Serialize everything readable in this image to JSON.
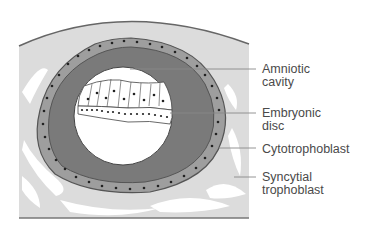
{
  "diagram": {
    "labels": [
      {
        "id": "amniotic-cavity",
        "lines": [
          "Amniotic",
          "cavity"
        ],
        "top": 63
      },
      {
        "id": "embryonic-disc",
        "lines": [
          "Embryonic",
          "disc"
        ],
        "top": 107
      },
      {
        "id": "cytotrophoblast",
        "lines": [
          "Cytotrophoblast"
        ],
        "top": 143
      },
      {
        "id": "syncytial-trophoblast",
        "lines": [
          "Syncytial",
          "trophoblast"
        ],
        "top": 171
      }
    ],
    "colors": {
      "endometrium": "#dcdcdc",
      "outer_line": "#666666",
      "cytotrophoblast_layer": "#9e9e9e",
      "dark_ring": "#7a7a7a",
      "cavity": "#ffffff",
      "nuclei": "#222222",
      "leader_line": "#888888",
      "text": "#4a4a4a"
    }
  }
}
